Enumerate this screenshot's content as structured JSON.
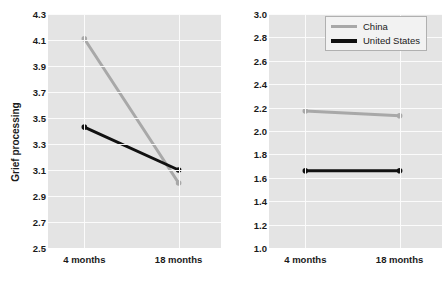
{
  "chart_data": [
    {
      "type": "line",
      "panel": "left",
      "title": "",
      "xlabel": "",
      "ylabel": "Grief processing",
      "categories": [
        "4 months",
        "18 months"
      ],
      "ylim": [
        2.5,
        4.3
      ],
      "yticks": [
        "4.3",
        "4.1",
        "3.9",
        "3.7",
        "3.5",
        "3.3",
        "3.1",
        "2.9",
        "2.7",
        "2.5"
      ],
      "ytick_values": [
        4.3,
        4.1,
        3.9,
        3.7,
        3.5,
        3.3,
        3.1,
        2.9,
        2.7,
        2.5
      ],
      "grid": true,
      "legend_position": "none",
      "series": [
        {
          "name": "China",
          "values": [
            4.11,
            3.0
          ],
          "color": "#a8a8a8"
        },
        {
          "name": "United States",
          "values": [
            3.43,
            3.1
          ],
          "color": "#111111"
        }
      ]
    },
    {
      "type": "line",
      "panel": "right",
      "title": "",
      "xlabel": "",
      "ylabel": "Grief avoidance",
      "categories": [
        "4 months",
        "18 months"
      ],
      "ylim": [
        1.0,
        3.0
      ],
      "yticks": [
        "3.0",
        "2.8",
        "2.6",
        "2.4",
        "2.2",
        "2.0",
        "1.8",
        "1.6",
        "1.4",
        "1.2",
        "1.0"
      ],
      "ytick_values": [
        3.0,
        2.8,
        2.6,
        2.4,
        2.2,
        2.0,
        1.8,
        1.6,
        1.4,
        1.2,
        1.0
      ],
      "grid": true,
      "legend_position": "top-right",
      "series": [
        {
          "name": "China",
          "values": [
            2.17,
            2.13
          ],
          "color": "#a8a8a8"
        },
        {
          "name": "United States",
          "values": [
            1.66,
            1.66
          ],
          "color": "#111111"
        }
      ]
    }
  ],
  "legend": {
    "items": [
      {
        "label": "China",
        "color": "#a8a8a8"
      },
      {
        "label": "United States",
        "color": "#111111"
      }
    ]
  },
  "colors": {
    "china": "#a8a8a8",
    "united_states": "#111111",
    "plot_background": "#e4e4e4",
    "gridline": "#fbfbfb",
    "text": "#1a1a1a"
  }
}
